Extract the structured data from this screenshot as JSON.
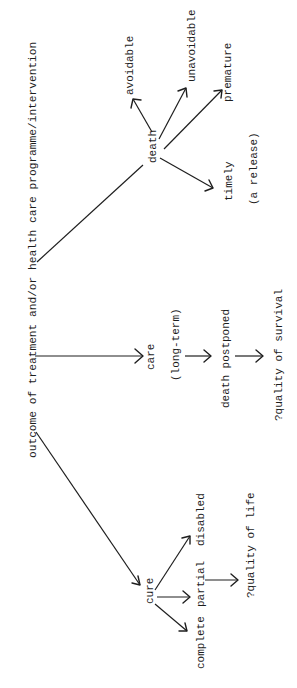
{
  "diagram": {
    "title": "outcome of treatment and/or health care programme/intervention",
    "orientation": "rotated -90deg (reads bottom-to-top)",
    "branches": {
      "death": {
        "label": "death",
        "children": [
          "avoidable",
          "unavoidable",
          "premature",
          "timely"
        ],
        "timely_note": "(a release)"
      },
      "care": {
        "label": "care",
        "note": "(long-term)",
        "next": "death postponed",
        "result": "?quality of survival"
      },
      "cure": {
        "label": "cure",
        "children": [
          "disabled",
          "partial",
          "complete"
        ],
        "result": "?quality of life"
      }
    }
  },
  "colors": {
    "background": "#ffffff",
    "ink": "#1e1e1e"
  }
}
